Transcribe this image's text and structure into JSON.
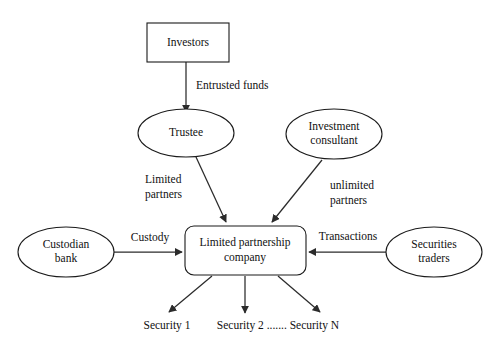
{
  "diagram": {
    "type": "flow-diagram",
    "background_color": "#ffffff",
    "line_color": "#2b2b2b",
    "text_color": "#111111",
    "nodes": {
      "investors": {
        "label": "Investors",
        "shape": "rectangle"
      },
      "trustee": {
        "label": "Trustee",
        "shape": "ellipse"
      },
      "investment_consultant": {
        "label_line1": "Investment",
        "label_line2": "consultant",
        "shape": "ellipse"
      },
      "custodian_bank": {
        "label_line1": "Custodian",
        "label_line2": "bank",
        "shape": "ellipse"
      },
      "securities_traders": {
        "label_line1": "Securities",
        "label_line2": "traders",
        "shape": "ellipse"
      },
      "limited_partnership_company": {
        "label_line1": "Limited partnership",
        "label_line2": "company",
        "shape": "rounded-rectangle"
      }
    },
    "edge_labels": {
      "entrusted_funds": "Entrusted funds",
      "limited_partners_line1": "Limited",
      "limited_partners_line2": "partners",
      "unlimited_partners_line1": "unlimited",
      "unlimited_partners_line2": "partners",
      "custody": "Custody",
      "transactions": "Transactions"
    },
    "outputs": {
      "security_1": "Security 1",
      "security_2_to_n": "Security 2 ....... Security N"
    }
  }
}
